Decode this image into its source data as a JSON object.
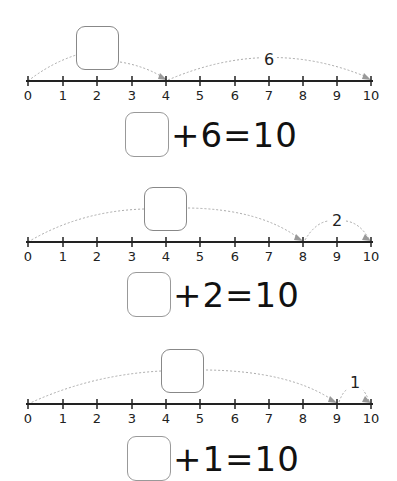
{
  "header": {
    "partial_title": ""
  },
  "axis": {
    "ticks": [
      "0",
      "1",
      "2",
      "3",
      "4",
      "5",
      "6",
      "7",
      "8",
      "9",
      "10"
    ]
  },
  "problems": [
    {
      "jump_label": "6",
      "jump_from": 4,
      "jump_to": 10,
      "unknown_from": 0,
      "unknown_to": 4,
      "equation": {
        "addend": "6",
        "sum": "10",
        "text": "+6=10"
      }
    },
    {
      "jump_label": "2",
      "jump_from": 8,
      "jump_to": 10,
      "unknown_from": 0,
      "unknown_to": 8,
      "equation": {
        "addend": "2",
        "sum": "10",
        "text": "+2=10"
      }
    },
    {
      "jump_label": "1",
      "jump_from": 9,
      "jump_to": 10,
      "unknown_from": 0,
      "unknown_to": 9,
      "equation": {
        "addend": "1",
        "sum": "10",
        "text": "+1=10"
      }
    }
  ],
  "colors": {
    "line": "#222222",
    "arc": "#aaaaaa",
    "box_border": "#888888"
  }
}
